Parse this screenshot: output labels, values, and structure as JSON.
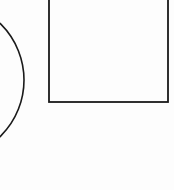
{
  "diagram": {
    "background": "#fdfdfd",
    "stroke_color": "#1a1a1a",
    "shapes": [
      {
        "type": "circle",
        "name": "circle",
        "description": "Large circle partially cropped by the left edge of the image",
        "cx": -55,
        "cy": 80,
        "r": 79,
        "stroke_width": 1.6
      },
      {
        "type": "rectangle",
        "name": "rectangle",
        "description": "Empty rectangle partially cropped by the top edge of the image",
        "x": 49,
        "y": -10,
        "width": 119,
        "height": 112,
        "stroke_width": 1.8
      }
    ]
  }
}
